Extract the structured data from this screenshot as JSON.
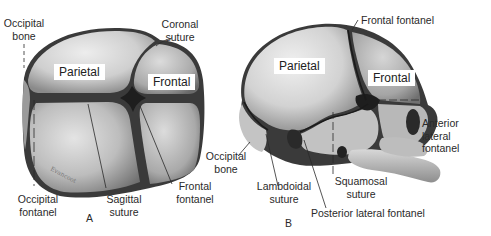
{
  "figure": {
    "panels": [
      {
        "id": "A",
        "view": "superior",
        "panel_label": "A",
        "bone_labels": [
          "Parietal",
          "Frontal"
        ],
        "callouts": [
          {
            "text": "Occipital\nbone"
          },
          {
            "text": "Coronal\nsuture"
          },
          {
            "text": "Occipital\nfontanel"
          },
          {
            "text": "Sagittal\nsuture"
          },
          {
            "text": "Frontal\nfontanel"
          }
        ]
      },
      {
        "id": "B",
        "view": "lateral",
        "panel_label": "B",
        "bone_labels": [
          "Parietal",
          "Frontal"
        ],
        "callouts": [
          {
            "text": "Frontal fontanel"
          },
          {
            "text": "Anterior\nlateral\nfontanel"
          },
          {
            "text": "Occipital\nbone"
          },
          {
            "text": "Lambdoidal\nsuture"
          },
          {
            "text": "Squamosal\nsuture"
          },
          {
            "text": "Posterior lateral fontanel"
          }
        ]
      }
    ]
  },
  "colors": {
    "bone_light": "#e6e6e6",
    "bone_mid": "#b4b4b4",
    "bone_dark": "#6e6e6e",
    "suture": "#1c1c1c",
    "text": "#2a2a2a",
    "background": "#ffffff"
  }
}
